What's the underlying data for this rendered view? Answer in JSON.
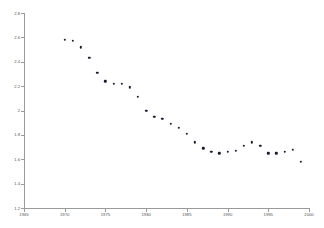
{
  "chart_data": {
    "type": "scatter",
    "title": "",
    "subtitle": "",
    "xlabel": "",
    "ylabel": "",
    "xlim": [
      1965,
      2000
    ],
    "ylim": [
      1.2,
      2.8
    ],
    "grid": false,
    "legend": null,
    "marker_color": "#1a1a2e",
    "axis_color": "#9a9a9a",
    "tick_label_color": "#555555",
    "x_ticks": [
      "1965",
      "1970",
      "1975",
      "1980",
      "1985",
      "1990",
      "1995",
      "2000"
    ],
    "x_tick_values": [
      1965,
      1970,
      1975,
      1980,
      1985,
      1990,
      1995,
      2000
    ],
    "y_ticks": [
      "1.2",
      "1.4",
      "1.6",
      "1.8",
      "2",
      "2.2",
      "2.4",
      "2.6",
      "2.8"
    ],
    "y_tick_values": [
      1.2,
      1.4,
      1.6,
      1.8,
      2.0,
      2.2,
      2.4,
      2.6,
      2.8
    ],
    "x": [
      1970,
      1971,
      1972,
      1973,
      1974,
      1975,
      1976,
      1977,
      1978,
      1979,
      1980,
      1981,
      1982,
      1983,
      1984,
      1985,
      1986,
      1987,
      1988,
      1989,
      1990,
      1991,
      1992,
      1993,
      1994,
      1995,
      1996,
      1997,
      1998,
      1999
    ],
    "y": [
      2.58,
      2.57,
      2.52,
      2.43,
      2.31,
      2.24,
      2.22,
      2.22,
      2.19,
      2.11,
      2.0,
      1.95,
      1.93,
      1.89,
      1.86,
      1.81,
      1.74,
      1.69,
      1.66,
      1.65,
      1.66,
      1.67,
      1.71,
      1.74,
      1.71,
      1.65,
      1.65,
      1.66,
      1.68,
      1.58
    ],
    "points": [
      {
        "x": 1970,
        "y": 2.58
      },
      {
        "x": 1971,
        "y": 2.57
      },
      {
        "x": 1972,
        "y": 2.52
      },
      {
        "x": 1973,
        "y": 2.43
      },
      {
        "x": 1974,
        "y": 2.31
      },
      {
        "x": 1975,
        "y": 2.24
      },
      {
        "x": 1976,
        "y": 2.22
      },
      {
        "x": 1977,
        "y": 2.22
      },
      {
        "x": 1978,
        "y": 2.19
      },
      {
        "x": 1979,
        "y": 2.11
      },
      {
        "x": 1980,
        "y": 2.0
      },
      {
        "x": 1981,
        "y": 1.95
      },
      {
        "x": 1982,
        "y": 1.93
      },
      {
        "x": 1983,
        "y": 1.89
      },
      {
        "x": 1984,
        "y": 1.86
      },
      {
        "x": 1985,
        "y": 1.81
      },
      {
        "x": 1986,
        "y": 1.74
      },
      {
        "x": 1987,
        "y": 1.69
      },
      {
        "x": 1988,
        "y": 1.66
      },
      {
        "x": 1989,
        "y": 1.65
      },
      {
        "x": 1990,
        "y": 1.66
      },
      {
        "x": 1991,
        "y": 1.67
      },
      {
        "x": 1992,
        "y": 1.71
      },
      {
        "x": 1993,
        "y": 1.74
      },
      {
        "x": 1994,
        "y": 1.71
      },
      {
        "x": 1995,
        "y": 1.65
      },
      {
        "x": 1996,
        "y": 1.65
      },
      {
        "x": 1997,
        "y": 1.66
      },
      {
        "x": 1998,
        "y": 1.68
      },
      {
        "x": 1999,
        "y": 1.58
      }
    ]
  }
}
